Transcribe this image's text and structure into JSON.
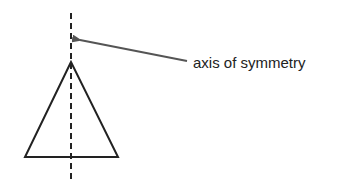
{
  "diagram": {
    "label": "axis of symmetry",
    "colors": {
      "stroke": "#222222",
      "arrow": "#555555",
      "background": "#ffffff"
    },
    "shapes": {
      "triangle": {
        "apex": [
          71,
          62
        ],
        "base_left": [
          25,
          157
        ],
        "base_right": [
          118,
          157
        ]
      },
      "axis_line": {
        "x": 71,
        "y1": 13,
        "y2": 183,
        "style": "dashed"
      },
      "arrow": {
        "from": [
          187,
          61
        ],
        "to": [
          72,
          38
        ]
      }
    }
  }
}
